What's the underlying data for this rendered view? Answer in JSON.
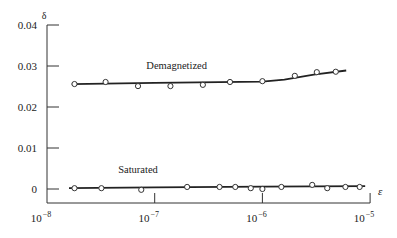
{
  "chart_data": {
    "type": "scatter",
    "title": "",
    "xlabel": "ε",
    "ylabel": "δ",
    "xscale": "log",
    "xlim": [
      1e-08,
      1e-05
    ],
    "ylim": [
      0,
      0.04
    ],
    "grid": false,
    "legend": "inline labels",
    "x_ticks": [
      {
        "value": 1e-08,
        "label": "10",
        "exp": "−8"
      },
      {
        "value": 1e-07,
        "label": "10",
        "exp": "−7"
      },
      {
        "value": 1e-06,
        "label": "10",
        "exp": "−6"
      },
      {
        "value": 1e-05,
        "label": "10",
        "exp": "−5"
      }
    ],
    "y_ticks": [
      {
        "value": 0,
        "label": "0"
      },
      {
        "value": 0.01,
        "label": "0.01"
      },
      {
        "value": 0.02,
        "label": "0.02"
      },
      {
        "value": 0.03,
        "label": "0.03"
      },
      {
        "value": 0.04,
        "label": "0.04"
      }
    ],
    "series": [
      {
        "name": "Demagnetized",
        "marker": "open-circle",
        "x": [
          1.8e-08,
          3.5e-08,
          7e-08,
          1.4e-07,
          2.8e-07,
          5e-07,
          1e-06,
          2e-06,
          3.2e-06,
          4.8e-06
        ],
        "y": [
          0.0256,
          0.0261,
          0.0251,
          0.0251,
          0.0254,
          0.0261,
          0.0263,
          0.0276,
          0.0285,
          0.0286
        ],
        "fit_line": {
          "x": [
            1.7e-08,
            1e-07,
            1e-06,
            1.6e-06,
            3e-06,
            6e-06
          ],
          "y": [
            0.0256,
            0.0259,
            0.0262,
            0.0267,
            0.0279,
            0.0289
          ]
        },
        "label_pos": {
          "x": 1.6e-07,
          "y": 0.0293
        }
      },
      {
        "name": "Saturated",
        "marker": "open-circle",
        "x": [
          1.8e-08,
          3.2e-08,
          7.5e-08,
          2e-07,
          4e-07,
          5.6e-07,
          7.8e-07,
          1e-06,
          1.5e-06,
          2.9e-06,
          4e-06,
          5.9e-06,
          8e-06
        ],
        "y": [
          0.0002,
          0.0002,
          -0.0002,
          0.0005,
          0.0005,
          0.0005,
          0.0002,
          0.0,
          0.0005,
          0.001,
          0.0002,
          0.0005,
          0.0005
        ],
        "fit_line": {
          "x": [
            1.6e-08,
            1e-07,
            1e-06,
            9e-06
          ],
          "y": [
            0.0002,
            0.0004,
            0.0006,
            0.0007
          ]
        },
        "label_pos": {
          "x": 7e-08,
          "y": 0.004
        }
      }
    ]
  }
}
